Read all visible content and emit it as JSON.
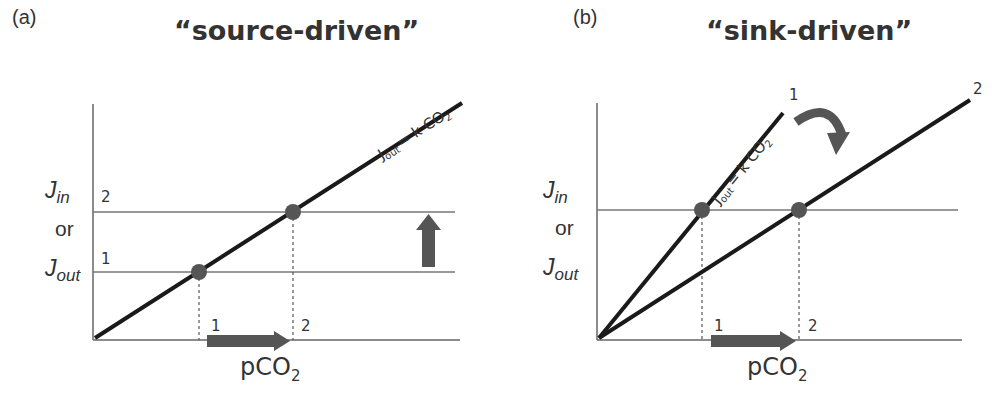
{
  "panels": [
    {
      "id": "a",
      "label": "(a)",
      "title": "“source-driven”",
      "y_axis_label": {
        "j_in": "J",
        "j_in_sub": "in",
        "or": "or",
        "j_out": "J",
        "j_out_sub": "out"
      },
      "x_axis_label": {
        "main": "pCO",
        "sub": "2"
      },
      "equation": {
        "j": "J",
        "sub": "out",
        "rest": "= k CO",
        "sub2": "2"
      },
      "level_labels": [
        "1",
        "2"
      ],
      "x_tick_labels": [
        "1",
        "2"
      ]
    },
    {
      "id": "b",
      "label": "(b)",
      "title": "“sink-driven”",
      "y_axis_label": {
        "j_in": "J",
        "j_in_sub": "in",
        "or": "or",
        "j_out": "J",
        "j_out_sub": "out"
      },
      "x_axis_label": {
        "main": "pCO",
        "sub": "2"
      },
      "equation": {
        "j": "J",
        "sub": "out",
        "rest": "= k CO",
        "sub2": "2"
      },
      "line_labels": [
        "1",
        "2"
      ],
      "x_tick_labels": [
        "1",
        "2"
      ]
    }
  ],
  "colors": {
    "line": "#1a1a1a",
    "axis": "#555555",
    "point": "#555555",
    "arrow": "#555555"
  }
}
